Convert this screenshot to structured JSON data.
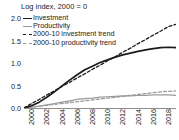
{
  "chart_data": {
    "type": "line",
    "title": "Log index, 2000 = 0",
    "xlabel": "",
    "ylabel": "",
    "xlim": [
      2000,
      2020
    ],
    "ylim": [
      0.0,
      2.0
    ],
    "grid": false,
    "legend_position": "top-left",
    "yticks": [
      "2.0",
      "1.5",
      "1.0",
      "0.5",
      "0.0"
    ],
    "ytick_values": [
      2.0,
      1.5,
      1.0,
      0.5,
      0.0
    ],
    "xticks": [
      "2000",
      "2002",
      "2004",
      "2006",
      "2008",
      "2010",
      "2012",
      "2014",
      "2016",
      "2018",
      "2020"
    ],
    "xtick_values": [
      2000,
      2002,
      2004,
      2006,
      2008,
      2010,
      2012,
      2014,
      2016,
      2018,
      2020
    ],
    "x": [
      2000,
      2001,
      2002,
      2003,
      2004,
      2005,
      2006,
      2007,
      2008,
      2009,
      2010,
      2011,
      2012,
      2013,
      2014,
      2015,
      2016,
      2017,
      2018,
      2019,
      2020
    ],
    "series": [
      {
        "name": "Investment",
        "style": "solid",
        "color": "#1a1a1a",
        "values": [
          0.0,
          0.05,
          0.13,
          0.24,
          0.36,
          0.49,
          0.62,
          0.74,
          0.85,
          0.93,
          1.01,
          1.07,
          1.13,
          1.18,
          1.22,
          1.26,
          1.29,
          1.32,
          1.34,
          1.35,
          1.34
        ]
      },
      {
        "name": "Productivity",
        "style": "solid",
        "color": "#9a9a9a",
        "values": [
          0.0,
          0.02,
          0.04,
          0.07,
          0.1,
          0.13,
          0.16,
          0.19,
          0.21,
          0.22,
          0.24,
          0.25,
          0.26,
          0.27,
          0.27,
          0.28,
          0.28,
          0.29,
          0.29,
          0.29,
          0.28
        ]
      },
      {
        "name": "2000-10 investment trend",
        "style": "dashed",
        "color": "#1a1a1a",
        "values": [
          0.0,
          0.1,
          0.19,
          0.29,
          0.38,
          0.48,
          0.57,
          0.67,
          0.76,
          0.86,
          0.95,
          1.05,
          1.14,
          1.24,
          1.33,
          1.43,
          1.52,
          1.62,
          1.71,
          1.81,
          1.86
        ]
      },
      {
        "name": "2000-10 productivity trend",
        "style": "dashed",
        "color": "#9a9a9a",
        "values": [
          0.0,
          0.02,
          0.04,
          0.06,
          0.08,
          0.1,
          0.12,
          0.14,
          0.16,
          0.18,
          0.2,
          0.22,
          0.24,
          0.26,
          0.28,
          0.3,
          0.32,
          0.34,
          0.36,
          0.37,
          0.38
        ]
      }
    ],
    "legend": [
      {
        "label": "Investment",
        "swatch": "solid-black"
      },
      {
        "label": "Productivity",
        "swatch": "solid-gray"
      },
      {
        "label": "2000-10 investment trend",
        "swatch": "dash-black"
      },
      {
        "label": "2000-10 productivity trend",
        "swatch": "dash-gray"
      }
    ],
    "colors": {
      "investment": "#1a1a1a",
      "productivity": "#9a9a9a",
      "axis": "#8d8d8d",
      "text": "#1a1a1a",
      "background": "#ffffff"
    }
  }
}
